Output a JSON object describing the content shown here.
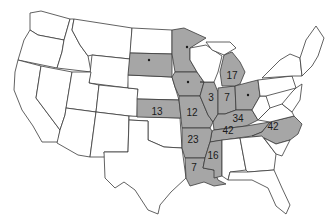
{
  "map": {
    "type": "choropleth",
    "region": "United States (contiguous)",
    "colors": {
      "shaded": "#a6a6a6",
      "unshaded": "#ffffff",
      "border": "#3a3a3a",
      "label": "#1a1a1a"
    },
    "labels": [
      {
        "state": "Kansas",
        "value": "13"
      },
      {
        "state": "Missouri",
        "value": "12"
      },
      {
        "state": "Illinois",
        "value": "3"
      },
      {
        "state": "Indiana",
        "value": "7"
      },
      {
        "state": "Michigan",
        "value": "17"
      },
      {
        "state": "Kentucky",
        "value": "34"
      },
      {
        "state": "Tennessee",
        "value": "42"
      },
      {
        "state": "North Carolina",
        "value": "42"
      },
      {
        "state": "Arkansas",
        "value": "23"
      },
      {
        "state": "Mississippi",
        "value": "16"
      },
      {
        "state": "Louisiana",
        "value": "7"
      }
    ],
    "dot_states": [
      "South Dakota",
      "Minnesota",
      "Iowa",
      "Ohio"
    ]
  }
}
